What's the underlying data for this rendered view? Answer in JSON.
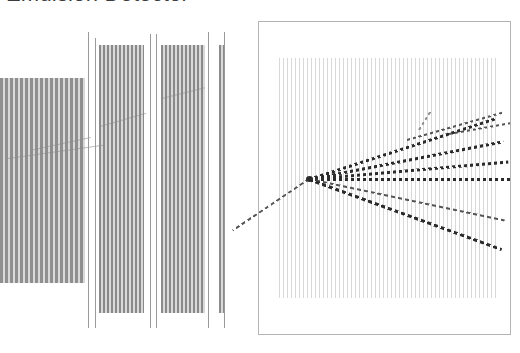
{
  "figure": {
    "title": "Emulsion Detector",
    "width": 520,
    "height": 353,
    "background": "#ffffff"
  },
  "colors": {
    "title_text": "#3c3c3c",
    "film_stripe_dark": "#8a8a8a",
    "film_stripe_light": "#d9d9d9",
    "separator_line": "#9a9a9a",
    "panel_border": "#b4b4b4",
    "event_stripe": "#d8d8d8",
    "track_dark": "#2b2b2b",
    "track_mid": "#555555",
    "track_faint": "#8d8d8d"
  },
  "left_panel": {
    "label": "emulsion-film-stacks",
    "bands": [
      {
        "name": "band-1",
        "x": 0,
        "y": 78,
        "width": 85,
        "height": 205,
        "pitch": 5,
        "stripe_width": 3,
        "tone": "#8f8f8f"
      },
      {
        "name": "band-2",
        "x": 99,
        "y": 45,
        "width": 45,
        "height": 268,
        "pitch": 4,
        "stripe_width": 2,
        "tone": "#8a8a8a"
      },
      {
        "name": "band-3",
        "x": 161,
        "y": 45,
        "width": 44,
        "height": 268,
        "pitch": 4,
        "stripe_width": 2,
        "tone": "#8a8a8a"
      },
      {
        "name": "band-4",
        "x": 219,
        "y": 45,
        "width": 6,
        "height": 268,
        "pitch": 4,
        "stripe_width": 2,
        "tone": "#8a8a8a"
      }
    ],
    "separators": [
      {
        "name": "separator-1",
        "x": 88,
        "y": 32,
        "height": 296
      },
      {
        "name": "separator-2",
        "x": 95,
        "y": 38,
        "height": 290
      },
      {
        "name": "separator-3",
        "x": 150,
        "y": 34,
        "height": 294
      },
      {
        "name": "separator-4",
        "x": 156,
        "y": 34,
        "height": 294
      },
      {
        "name": "separator-5",
        "x": 208,
        "y": 32,
        "height": 296
      },
      {
        "name": "separator-6",
        "x": 224,
        "y": 32,
        "height": 296
      }
    ],
    "tracks": [
      {
        "name": "left-track-1",
        "x": 8,
        "y": 158,
        "length": 96,
        "angle": -8
      },
      {
        "name": "left-track-2",
        "x": 30,
        "y": 150,
        "length": 62,
        "angle": -12
      },
      {
        "name": "left-track-3",
        "x": 100,
        "y": 126,
        "length": 48,
        "angle": -16
      },
      {
        "name": "left-track-4",
        "x": 162,
        "y": 98,
        "length": 44,
        "angle": -14
      }
    ]
  },
  "right_panel": {
    "label": "event-display-panel",
    "frame": {
      "x": 258,
      "y": 21,
      "width": 253,
      "height": 314
    },
    "stripe_field": {
      "x": 20,
      "y": 36,
      "width": 220,
      "height": 240,
      "pitch": 4,
      "stripe_width": 1
    },
    "vertex": {
      "x": 50,
      "y": 157,
      "label": "interaction-vertex"
    },
    "tracks": [
      {
        "name": "incoming-beam-track",
        "x": 50,
        "y": 157,
        "length": 92,
        "angle": 146,
        "weight": "mid",
        "thickness": 2,
        "dash": 7
      },
      {
        "name": "outgoing-track-1",
        "x": 50,
        "y": 157,
        "length": 196,
        "angle": -18,
        "weight": "dark",
        "thickness": 3,
        "dash": 6
      },
      {
        "name": "outgoing-track-2",
        "x": 50,
        "y": 157,
        "length": 198,
        "angle": -11,
        "weight": "dark",
        "thickness": 3,
        "dash": 6
      },
      {
        "name": "outgoing-track-3",
        "x": 50,
        "y": 157,
        "length": 200,
        "angle": -5,
        "weight": "dark",
        "thickness": 3,
        "dash": 6
      },
      {
        "name": "outgoing-track-4",
        "x": 50,
        "y": 157,
        "length": 202,
        "angle": 0,
        "weight": "dark",
        "thickness": 3,
        "dash": 6
      },
      {
        "name": "outgoing-track-5",
        "x": 50,
        "y": 157,
        "length": 200,
        "angle": 12,
        "weight": "mid",
        "thickness": 2,
        "dash": 7
      },
      {
        "name": "outgoing-track-6",
        "x": 50,
        "y": 157,
        "length": 205,
        "angle": 20,
        "weight": "dark",
        "thickness": 3,
        "dash": 7
      },
      {
        "name": "secondary-track-1",
        "x": 148,
        "y": 118,
        "length": 100,
        "angle": -16,
        "weight": "mid",
        "thickness": 2,
        "dash": 6
      },
      {
        "name": "secondary-track-2",
        "x": 160,
        "y": 108,
        "length": 22,
        "angle": -58,
        "weight": "faint",
        "thickness": 2,
        "dash": 6
      },
      {
        "name": "secondary-track-3",
        "x": 190,
        "y": 112,
        "length": 62,
        "angle": -10,
        "weight": "mid",
        "thickness": 2,
        "dash": 6
      }
    ]
  }
}
